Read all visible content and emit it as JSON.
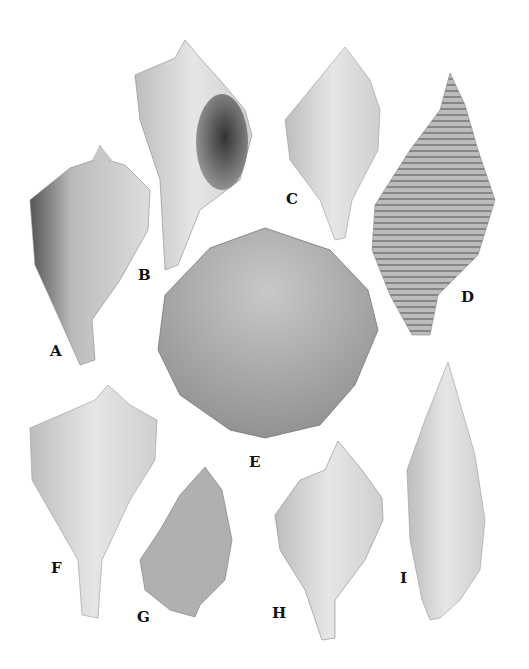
{
  "figure": {
    "type": "specimen-plate",
    "background": "#ffffff",
    "specimens": [
      {
        "label": "A",
        "kind": "gastropod (knobbed whelk-like, spire with nodes)"
      },
      {
        "label": "B",
        "kind": "gastropod (whelk, aperture view)"
      },
      {
        "label": "C",
        "kind": "gastropod (smooth fusiform)"
      },
      {
        "label": "D",
        "kind": "gastropod (ribbed, cancellate fusiform)"
      },
      {
        "label": "E",
        "kind": "bivalve (scallop, radial ribs)"
      },
      {
        "label": "F",
        "kind": "gastropod (pear whelk with long canal)"
      },
      {
        "label": "G",
        "kind": "gastropod (bulbous, spiral-striated)"
      },
      {
        "label": "H",
        "kind": "gastropod (whelk with stepped spire)"
      },
      {
        "label": "I",
        "kind": "gastropod (elongate volute, aperture view)"
      }
    ]
  }
}
